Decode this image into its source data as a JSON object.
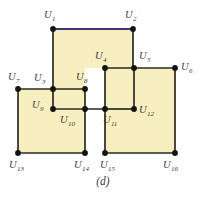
{
  "figure": {
    "caption": "(d)",
    "colors": {
      "fill": "#f7efc0",
      "edge": "#2b2b20",
      "highlight_edge": "#3f3a6e",
      "vertex": "#141410",
      "label_text": "#3b3b3b",
      "background": "#ffffff"
    },
    "geometry": {
      "view_width": 206,
      "view_height": 204
    },
    "faces": [
      {
        "name": "top-square",
        "points": "53,29 133,29 133,109 105,109 105,68 85,68 85,89 53,89"
      },
      {
        "name": "left-square",
        "points": "18,89 53,89 53,109 85,109 85,153 18,153"
      },
      {
        "name": "middle-small-square",
        "points": "53,89 85,89 85,109 53,109"
      },
      {
        "name": "right-square",
        "points": "105,68 175,68 175,153 105,153"
      }
    ],
    "edges": [
      {
        "name": "edge-u1-u2",
        "x1": 53,
        "y1": 29,
        "x2": 133,
        "y2": 29,
        "highlight": true
      },
      {
        "name": "edge-u1-u3",
        "x1": 53,
        "y1": 29,
        "x2": 53,
        "y2": 89,
        "highlight": false
      },
      {
        "name": "edge-u2-u5",
        "x1": 133,
        "y1": 29,
        "x2": 133,
        "y2": 68,
        "highlight": false
      },
      {
        "name": "edge-u5-u12",
        "x1": 134,
        "y1": 68,
        "x2": 134,
        "y2": 109,
        "highlight": false
      },
      {
        "name": "edge-u3-u8",
        "x1": 53,
        "y1": 89,
        "x2": 85,
        "y2": 89,
        "highlight": false
      },
      {
        "name": "edge-u8-u10",
        "x1": 85,
        "y1": 89,
        "x2": 85,
        "y2": 109,
        "highlight": false
      },
      {
        "name": "edge-u4-u6",
        "x1": 105,
        "y1": 68,
        "x2": 175,
        "y2": 68,
        "highlight": false
      },
      {
        "name": "edge-u4-u11",
        "x1": 105,
        "y1": 68,
        "x2": 105,
        "y2": 109,
        "highlight": false
      },
      {
        "name": "edge-u11-u12",
        "x1": 105,
        "y1": 109,
        "x2": 134,
        "y2": 109,
        "highlight": false
      },
      {
        "name": "edge-u6-u16",
        "x1": 175,
        "y1": 68,
        "x2": 175,
        "y2": 153,
        "highlight": false
      },
      {
        "name": "edge-u11-u15",
        "x1": 105,
        "y1": 109,
        "x2": 105,
        "y2": 153,
        "highlight": false
      },
      {
        "name": "edge-u15-u16",
        "x1": 105,
        "y1": 153,
        "x2": 175,
        "y2": 153,
        "highlight": false
      },
      {
        "name": "edge-u7-u3",
        "x1": 18,
        "y1": 89,
        "x2": 53,
        "y2": 89,
        "highlight": false
      },
      {
        "name": "edge-u7-u13",
        "x1": 18,
        "y1": 89,
        "x2": 18,
        "y2": 153,
        "highlight": false
      },
      {
        "name": "edge-u9-u11",
        "x1": 53,
        "y1": 109,
        "x2": 105,
        "y2": 109,
        "highlight": false
      },
      {
        "name": "edge-u3-u9",
        "x1": 53,
        "y1": 89,
        "x2": 53,
        "y2": 109,
        "highlight": false
      },
      {
        "name": "edge-u10-u14",
        "x1": 85,
        "y1": 109,
        "x2": 85,
        "y2": 153,
        "highlight": false
      },
      {
        "name": "edge-u13-u14",
        "x1": 18,
        "y1": 153,
        "x2": 85,
        "y2": 153,
        "highlight": false
      }
    ],
    "vertices": [
      {
        "id": "U1",
        "label": "U",
        "sub": "1",
        "cx": 53,
        "cy": 29,
        "lx": 44,
        "ly": 10
      },
      {
        "id": "U2",
        "label": "U",
        "sub": "2",
        "cx": 133,
        "cy": 29,
        "lx": 125,
        "ly": 10
      },
      {
        "id": "U3",
        "label": "U",
        "sub": "3",
        "cx": 53,
        "cy": 89,
        "lx": 34,
        "ly": 73
      },
      {
        "id": "U4",
        "label": "U",
        "sub": "4",
        "cx": 105,
        "cy": 68,
        "lx": 95,
        "ly": 51
      },
      {
        "id": "U5",
        "label": "U",
        "sub": "5",
        "cx": 134,
        "cy": 68,
        "lx": 139,
        "ly": 51
      },
      {
        "id": "U6",
        "label": "U",
        "sub": "6",
        "cx": 175,
        "cy": 68,
        "lx": 181,
        "ly": 62
      },
      {
        "id": "U7",
        "label": "U",
        "sub": "7",
        "cx": 18,
        "cy": 89,
        "lx": 8,
        "ly": 72
      },
      {
        "id": "U8",
        "label": "U",
        "sub": "8",
        "cx": 85,
        "cy": 89,
        "lx": 76,
        "ly": 72
      },
      {
        "id": "U9",
        "label": "U",
        "sub": "9",
        "cx": 53,
        "cy": 109,
        "lx": 32,
        "ly": 100
      },
      {
        "id": "U10",
        "label": "U",
        "sub": "10",
        "cx": 85,
        "cy": 109,
        "lx": 60,
        "ly": 115
      },
      {
        "id": "U11",
        "label": "U",
        "sub": "11",
        "cx": 105,
        "cy": 109,
        "lx": 103,
        "ly": 115
      },
      {
        "id": "U12",
        "label": "U",
        "sub": "12",
        "cx": 134,
        "cy": 109,
        "lx": 139,
        "ly": 105
      },
      {
        "id": "U13",
        "label": "U",
        "sub": "13",
        "cx": 18,
        "cy": 153,
        "lx": 9,
        "ly": 160
      },
      {
        "id": "U14",
        "label": "U",
        "sub": "14",
        "cx": 85,
        "cy": 153,
        "lx": 74,
        "ly": 160
      },
      {
        "id": "U15",
        "label": "U",
        "sub": "15",
        "cx": 105,
        "cy": 153,
        "lx": 100,
        "ly": 160
      },
      {
        "id": "U16",
        "label": "U",
        "sub": "16",
        "cx": 175,
        "cy": 153,
        "lx": 163,
        "ly": 160
      }
    ]
  }
}
